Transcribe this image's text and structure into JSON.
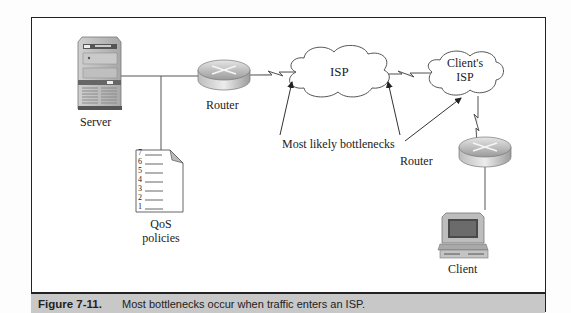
{
  "diagram": {
    "nodes": {
      "server": {
        "label": "Server"
      },
      "router1": {
        "label": "Router"
      },
      "isp": {
        "label": "ISP"
      },
      "client_isp": {
        "label_line1": "Client's",
        "label_line2": "ISP"
      },
      "router2": {
        "label": "Router"
      },
      "client": {
        "label": "Client"
      },
      "qos": {
        "label_line1": "QoS",
        "label_line2": "policies",
        "list_numbers": [
          "7",
          "6",
          "5",
          "4",
          "3",
          "2",
          "1"
        ]
      }
    },
    "annotation": {
      "label": "Most likely bottlenecks"
    },
    "colors": {
      "line": "#444444",
      "cloud_fill": "#ffffff",
      "cloud_stroke": "#555555",
      "caption_bg": "#c8c8c8"
    }
  },
  "caption": {
    "number": "Figure 7-11.",
    "text": "Most bottlenecks occur when traffic enters an ISP."
  }
}
